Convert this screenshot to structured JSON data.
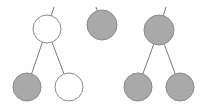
{
  "colors": {
    "background": "#ffffff",
    "edge": "#7a7a7a",
    "node_stroke": "#8a8a8a",
    "node_filled": "#a9a9a9",
    "node_empty": "#ffffff"
  },
  "trees": [
    {
      "name": "tree-left",
      "root": {
        "cx": 47,
        "cy": 29,
        "r": 14,
        "filled": false,
        "parent_stub": {
          "x": 54,
          "y": 7
        }
      },
      "children": [
        {
          "cx": 27,
          "cy": 87,
          "r": 14,
          "filled": true
        },
        {
          "cx": 69,
          "cy": 87,
          "r": 14,
          "filled": false
        }
      ]
    },
    {
      "name": "tree-middle",
      "root": {
        "cx": 102,
        "cy": 25,
        "r": 15,
        "filled": true,
        "parent_stub": {
          "x": 96,
          "y": 7
        }
      },
      "children": []
    },
    {
      "name": "tree-right",
      "root": {
        "cx": 159,
        "cy": 30,
        "r": 15,
        "filled": true,
        "parent_stub": {
          "x": 166,
          "y": 7
        }
      },
      "children": [
        {
          "cx": 138,
          "cy": 87,
          "r": 14,
          "filled": true
        },
        {
          "cx": 180,
          "cy": 87,
          "r": 14,
          "filled": true
        }
      ]
    }
  ]
}
